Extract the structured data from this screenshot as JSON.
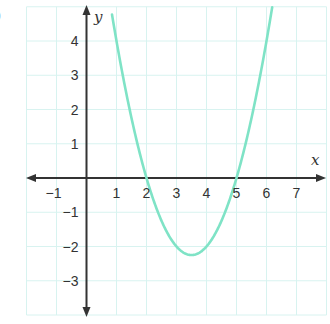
{
  "corner_label": ")",
  "chart_data": {
    "type": "line",
    "title": "",
    "xlabel": "x",
    "ylabel": "y",
    "xlim": [
      -2,
      8
    ],
    "ylim": [
      -4,
      5
    ],
    "grid": true,
    "x_ticks": [
      -1,
      1,
      2,
      3,
      4,
      5,
      6,
      7
    ],
    "y_ticks": [
      4,
      3,
      2,
      1,
      -1,
      -2,
      -3
    ],
    "series": [
      {
        "name": "y = (x - 2)(x - 5)",
        "color": "#7fe3c6",
        "x": [
          0.85,
          1,
          1.5,
          2,
          2.5,
          3,
          3.5,
          4,
          4.5,
          5,
          5.5,
          6,
          6.2
        ],
        "values": [
          4.77,
          4,
          1.75,
          0,
          -1.25,
          -2,
          -2.25,
          -2,
          -1.25,
          0,
          1.75,
          4,
          5.04
        ]
      }
    ],
    "annotations": {
      "x_intercepts": [
        2,
        5
      ],
      "vertex": [
        3.5,
        -2.25
      ]
    }
  },
  "colors": {
    "grid": "#d8f3f0",
    "axis": "#333333",
    "curve": "#7fe3c6"
  }
}
